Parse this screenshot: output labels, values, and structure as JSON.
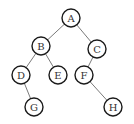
{
  "diagram": {
    "type": "binary-tree",
    "colors": {
      "background": "#ffffff",
      "node_stroke": "#1a1a1a",
      "node_fill": "#ffffff",
      "edge": "#7a7a7a",
      "label": "#333333"
    },
    "node_radius": 9,
    "nodes": [
      {
        "id": "A",
        "label": "A",
        "x": 71,
        "y": 18
      },
      {
        "id": "B",
        "label": "B",
        "x": 41,
        "y": 46
      },
      {
        "id": "C",
        "label": "C",
        "x": 97,
        "y": 49
      },
      {
        "id": "D",
        "label": "D",
        "x": 21,
        "y": 75
      },
      {
        "id": "E",
        "label": "E",
        "x": 58,
        "y": 75
      },
      {
        "id": "F",
        "label": "F",
        "x": 84,
        "y": 75
      },
      {
        "id": "G",
        "label": "G",
        "x": 34,
        "y": 107
      },
      {
        "id": "H",
        "label": "H",
        "x": 113,
        "y": 107
      }
    ],
    "edges": [
      {
        "from": "A",
        "to": "B"
      },
      {
        "from": "A",
        "to": "C"
      },
      {
        "from": "B",
        "to": "D"
      },
      {
        "from": "B",
        "to": "E"
      },
      {
        "from": "C",
        "to": "F"
      },
      {
        "from": "D",
        "to": "G"
      },
      {
        "from": "F",
        "to": "H"
      }
    ]
  }
}
